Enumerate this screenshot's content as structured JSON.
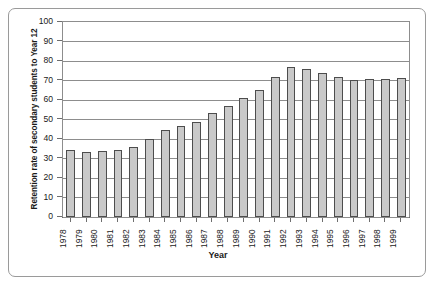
{
  "chart_data": {
    "type": "bar",
    "title": "",
    "xlabel": "Year",
    "ylabel": "Retention rate of secondary students to Year 12",
    "ylim": [
      0,
      100
    ],
    "ytick_labels": [
      "100",
      "90",
      "80",
      "70",
      "60",
      "50",
      "40",
      "30",
      "20",
      "10",
      "0"
    ],
    "ytick_values": [
      100,
      90,
      80,
      70,
      60,
      50,
      40,
      30,
      20,
      10,
      0
    ],
    "grid": true,
    "legend": "none",
    "categories": [
      "1978",
      "1979",
      "1980",
      "1981",
      "1982",
      "1983",
      "1984",
      "1985",
      "1986",
      "1987",
      "1988",
      "1989",
      "1990",
      "1991",
      "1992",
      "1993",
      "1994",
      "1995",
      "1996",
      "1997",
      "1998",
      "1999"
    ],
    "values": [
      34.5,
      33.5,
      34,
      34.5,
      36,
      40,
      44.5,
      46.5,
      48.5,
      53.5,
      57,
      61,
      65,
      72,
      77,
      76,
      74,
      72,
      70.5,
      71,
      71,
      71.5
    ],
    "bar_fill_color": "#c9c9c9",
    "bar_edge_color": "#4d4d4d",
    "grid_color": "#8d8d8d",
    "axis_color": "#4a4a4a",
    "frame_color": "#9a9a9a"
  }
}
